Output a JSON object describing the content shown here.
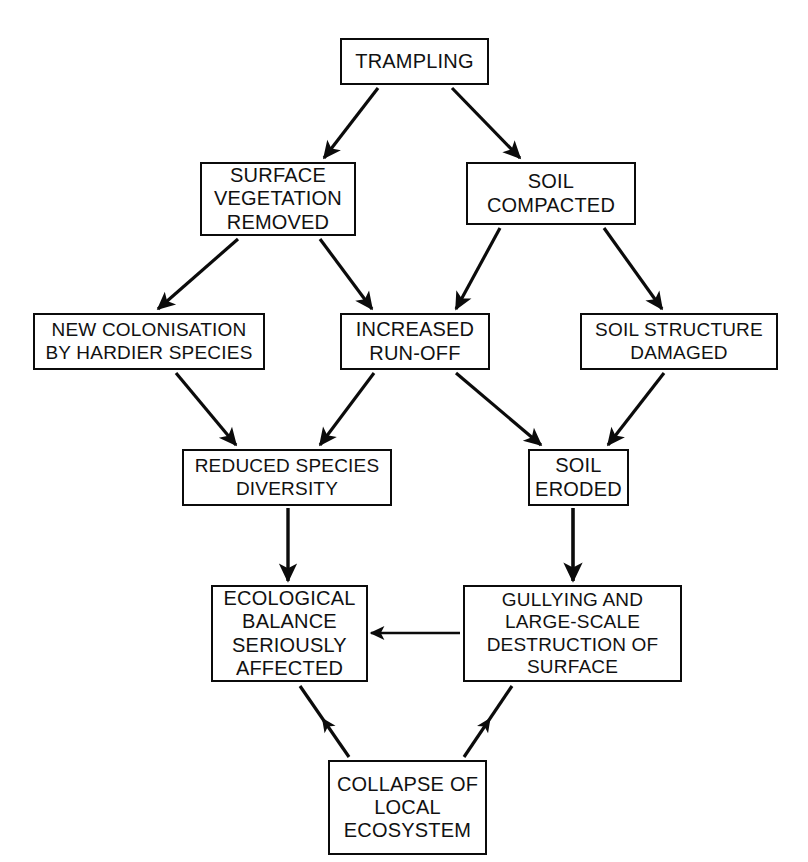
{
  "figure": {
    "cut_off_header": "",
    "background_color": "#ffffff",
    "line_color": "#0b0b0b",
    "text_color": "#111111"
  },
  "nodes": [
    {
      "id": "trampling",
      "label": "TRAMPLING",
      "x": 340,
      "y": 38,
      "w": 149,
      "h": 47,
      "size": "md"
    },
    {
      "id": "surface-vegetation-removed",
      "label": "SURFACE\nVEGETATION\nREMOVED",
      "x": 200,
      "y": 162,
      "w": 156,
      "h": 74,
      "size": "md"
    },
    {
      "id": "soil-compacted",
      "label": "SOIL\nCOMPACTED",
      "x": 466,
      "y": 162,
      "w": 170,
      "h": 63,
      "size": "md"
    },
    {
      "id": "new-colonisation-by-hardier-species",
      "label": "NEW COLONISATION\nBY HARDIER SPECIES",
      "x": 33,
      "y": 313,
      "w": 232,
      "h": 57,
      "size": "sm"
    },
    {
      "id": "increased-run-off",
      "label": "INCREASED\nRUN-OFF",
      "x": 340,
      "y": 313,
      "w": 150,
      "h": 57,
      "size": "md"
    },
    {
      "id": "soil-structure-damaged",
      "label": "SOIL STRUCTURE\nDAMAGED",
      "x": 580,
      "y": 313,
      "w": 198,
      "h": 57,
      "size": "sm"
    },
    {
      "id": "reduced-species-diversity",
      "label": "REDUCED SPECIES\nDIVERSITY",
      "x": 182,
      "y": 449,
      "w": 210,
      "h": 57,
      "size": "sm"
    },
    {
      "id": "soil-eroded",
      "label": "SOIL\nERODED",
      "x": 528,
      "y": 449,
      "w": 101,
      "h": 57,
      "size": "md"
    },
    {
      "id": "ecological-balance-seriously-affected",
      "label": "ECOLOGICAL\nBALANCE\nSERIOUSLY\nAFFECTED",
      "x": 211,
      "y": 585,
      "w": 157,
      "h": 97,
      "size": "md"
    },
    {
      "id": "gullying-and-large-scale-destruction-of-surface",
      "label": "GULLYING AND\nLARGE-SCALE\nDESTRUCTION OF\nSURFACE",
      "x": 463,
      "y": 585,
      "w": 219,
      "h": 97,
      "size": "sm"
    },
    {
      "id": "collapse-of-local-ecosystem",
      "label": "COLLAPSE OF\nLOCAL\nECOSYSTEM",
      "x": 328,
      "y": 760,
      "w": 159,
      "h": 95,
      "size": "md"
    }
  ],
  "edges": [
    {
      "id": "trampling-to-surface-vegetation-removed",
      "from": "trampling",
      "to": "surface-vegetation-removed",
      "x1": 378,
      "y1": 88,
      "x2": 324,
      "y2": 158,
      "width": 3.2,
      "arrow": "end"
    },
    {
      "id": "trampling-to-soil-compacted",
      "from": "trampling",
      "to": "soil-compacted",
      "x1": 452,
      "y1": 88,
      "x2": 520,
      "y2": 158,
      "width": 3.2,
      "arrow": "end"
    },
    {
      "id": "surface-vegetation-removed-to-new-colonisation",
      "from": "surface-vegetation-removed",
      "to": "new-colonisation-by-hardier-species",
      "x1": 238,
      "y1": 239,
      "x2": 158,
      "y2": 309,
      "width": 3.2,
      "arrow": "end"
    },
    {
      "id": "surface-vegetation-removed-to-increased-run-off",
      "from": "surface-vegetation-removed",
      "to": "increased-run-off",
      "x1": 320,
      "y1": 239,
      "x2": 372,
      "y2": 309,
      "width": 3.2,
      "arrow": "end"
    },
    {
      "id": "soil-compacted-to-increased-run-off",
      "from": "soil-compacted",
      "to": "increased-run-off",
      "x1": 500,
      "y1": 228,
      "x2": 456,
      "y2": 309,
      "width": 3.2,
      "arrow": "end"
    },
    {
      "id": "soil-compacted-to-soil-structure-damaged",
      "from": "soil-compacted",
      "to": "soil-structure-damaged",
      "x1": 604,
      "y1": 228,
      "x2": 662,
      "y2": 309,
      "width": 3.2,
      "arrow": "end"
    },
    {
      "id": "new-colonisation-to-reduced-species-diversity",
      "from": "new-colonisation-by-hardier-species",
      "to": "reduced-species-diversity",
      "x1": 176,
      "y1": 373,
      "x2": 236,
      "y2": 445,
      "width": 3.2,
      "arrow": "end"
    },
    {
      "id": "increased-run-off-to-reduced-species-diversity",
      "from": "increased-run-off",
      "to": "reduced-species-diversity",
      "x1": 374,
      "y1": 373,
      "x2": 320,
      "y2": 445,
      "width": 3.2,
      "arrow": "end"
    },
    {
      "id": "increased-run-off-to-soil-eroded",
      "from": "increased-run-off",
      "to": "soil-eroded",
      "x1": 456,
      "y1": 373,
      "x2": 541,
      "y2": 445,
      "width": 3.2,
      "arrow": "end"
    },
    {
      "id": "soil-structure-damaged-to-soil-eroded",
      "from": "soil-structure-damaged",
      "to": "soil-eroded",
      "x1": 664,
      "y1": 373,
      "x2": 608,
      "y2": 445,
      "width": 3.2,
      "arrow": "end"
    },
    {
      "id": "reduced-species-diversity-to-ecological-balance",
      "from": "reduced-species-diversity",
      "to": "ecological-balance-seriously-affected",
      "x1": 288,
      "y1": 508,
      "x2": 288,
      "y2": 581,
      "width": 3.4,
      "arrow": "end"
    },
    {
      "id": "soil-eroded-to-gullying",
      "from": "soil-eroded",
      "to": "gullying-and-large-scale-destruction-of-surface",
      "x1": 573,
      "y1": 508,
      "x2": 573,
      "y2": 581,
      "width": 3.6,
      "arrow": "end"
    },
    {
      "id": "gullying-to-ecological-balance",
      "from": "gullying-and-large-scale-destruction-of-surface",
      "to": "ecological-balance-seriously-affected",
      "x1": 460,
      "y1": 633,
      "x2": 371,
      "y2": 633,
      "width": 2.6,
      "arrow": "end"
    },
    {
      "id": "collapse-to-ecological-balance",
      "from": "collapse-of-local-ecosystem",
      "to": "ecological-balance-seriously-affected",
      "x1": 349,
      "y1": 757,
      "x2": 300,
      "y2": 686,
      "width": 3.2,
      "arrow": "mid"
    },
    {
      "id": "collapse-to-gullying",
      "from": "collapse-of-local-ecosystem",
      "to": "gullying-and-large-scale-destruction-of-surface",
      "x1": 464,
      "y1": 757,
      "x2": 512,
      "y2": 686,
      "width": 3.2,
      "arrow": "mid"
    }
  ]
}
